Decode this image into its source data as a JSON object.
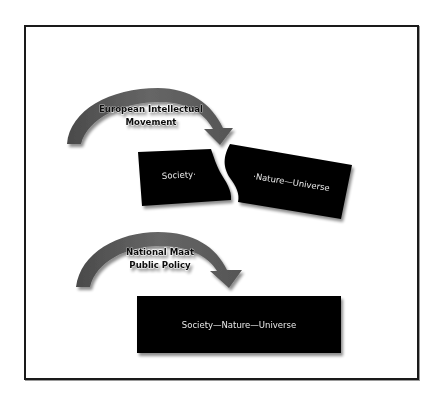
{
  "diagram": {
    "top_section": {
      "arrow_label_lines": [
        "European Intellectual",
        "Movement"
      ],
      "left_fragment_text": "Society·",
      "right_fragment_text": "·Nature—Universe"
    },
    "bottom_section": {
      "arrow_label_lines": [
        "National Maat",
        "Public Policy"
      ],
      "unified_box_text": "Society—Nature—Universe"
    },
    "colors": {
      "arrow": "#5a5a5a",
      "box": "#000000",
      "box_text": "#e8e8e8",
      "frame": "#1a1a1a"
    }
  }
}
